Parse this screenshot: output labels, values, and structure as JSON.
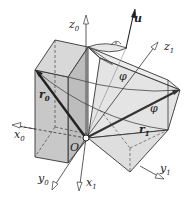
{
  "figure": {
    "type": "3d-rotation-diagram",
    "colors": {
      "box_original_face": "#c8c8c8",
      "box_original_top": "#d8d8d8",
      "box_rotated_face": "#e2e2e2",
      "box_rotated_top": "#ececec",
      "lines": "#333333",
      "vector": "#2a2a2a",
      "background": "#ffffff"
    },
    "labels": {
      "origin": "O",
      "axis_u": "u",
      "angle_top": "φ",
      "angle_right": "φ",
      "vec_r0": {
        "base": "r",
        "sub": "0"
      },
      "vec_r1": {
        "base": "r",
        "sub": "1"
      },
      "x0": {
        "base": "x",
        "sub": "0"
      },
      "y0": {
        "base": "y",
        "sub": "0"
      },
      "z0": {
        "base": "z",
        "sub": "0"
      },
      "x1": {
        "base": "x",
        "sub": "1"
      },
      "y1": {
        "base": "y",
        "sub": "1"
      },
      "z1": {
        "base": "z",
        "sub": "1"
      }
    }
  }
}
